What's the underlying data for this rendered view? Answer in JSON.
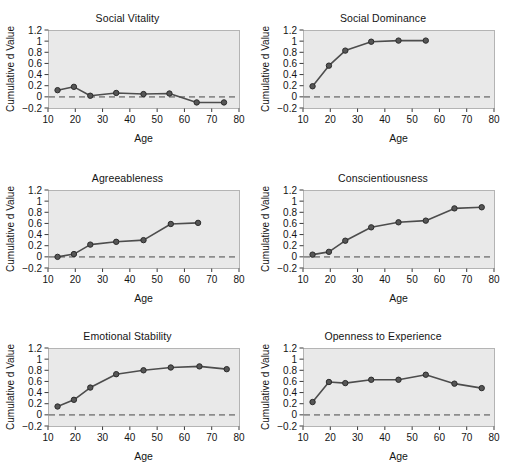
{
  "figure": {
    "axis_labels": {
      "x": "Age",
      "y": "Cumulative d Value"
    },
    "colors": {
      "plot_background": "#e9e9e9",
      "plot_border": "#b4b4b4",
      "line": "#4d4d4d",
      "marker_fill": "#565656",
      "marker_stroke": "#2b2b2b",
      "zero_line": "#8c8c8c",
      "text": "#141414",
      "page_background": "#ffffff"
    },
    "x_ticks": [
      "10",
      "20",
      "30",
      "40",
      "50",
      "60",
      "70",
      "80"
    ],
    "y_ticks": [
      "1.2",
      "1",
      "0.8",
      "0.6",
      "0.4",
      "0.2",
      "0",
      "−0.2"
    ]
  },
  "chart_data": [
    {
      "type": "line",
      "title": "Social Vitality",
      "xlabel": "Age",
      "ylabel": "Cumulative d Value",
      "xlim": [
        10,
        80
      ],
      "ylim": [
        -0.2,
        1.2
      ],
      "xticks": [
        10,
        20,
        30,
        40,
        50,
        60,
        70,
        80
      ],
      "yticks": [
        -0.2,
        0,
        0.2,
        0.4,
        0.6,
        0.8,
        1,
        1.2
      ],
      "grid": false,
      "legend": "none",
      "reference_line": {
        "y": 0,
        "style": "dashed"
      },
      "x": [
        13.5,
        19.5,
        25.5,
        35,
        45,
        54.5,
        64.5,
        74.5
      ],
      "values": [
        0.12,
        0.18,
        0.02,
        0.07,
        0.05,
        0.06,
        -0.1,
        -0.1
      ]
    },
    {
      "type": "line",
      "title": "Social Dominance",
      "xlabel": "Age",
      "ylabel": "Cumulative d Value",
      "xlim": [
        10,
        80
      ],
      "ylim": [
        -0.2,
        1.2
      ],
      "xticks": [
        10,
        20,
        30,
        40,
        50,
        60,
        70,
        80
      ],
      "yticks": [
        -0.2,
        0,
        0.2,
        0.4,
        0.6,
        0.8,
        1,
        1.2
      ],
      "grid": false,
      "legend": "none",
      "reference_line": {
        "y": 0,
        "style": "dashed"
      },
      "x": [
        13.5,
        19.5,
        25.5,
        35,
        45,
        55
      ],
      "values": [
        0.19,
        0.56,
        0.83,
        0.99,
        1.01,
        1.01
      ]
    },
    {
      "type": "line",
      "title": "Agreeableness",
      "xlabel": "Age",
      "ylabel": "Cumulative d Value",
      "xlim": [
        10,
        80
      ],
      "ylim": [
        -0.2,
        1.2
      ],
      "xticks": [
        10,
        20,
        30,
        40,
        50,
        60,
        70,
        80
      ],
      "yticks": [
        -0.2,
        0,
        0.2,
        0.4,
        0.6,
        0.8,
        1,
        1.2
      ],
      "grid": false,
      "legend": "none",
      "reference_line": {
        "y": 0,
        "style": "dashed"
      },
      "x": [
        13.5,
        19.5,
        25.5,
        35,
        45,
        55,
        65
      ],
      "values": [
        0.0,
        0.05,
        0.22,
        0.27,
        0.3,
        0.59,
        0.61
      ]
    },
    {
      "type": "line",
      "title": "Conscientiousness",
      "xlabel": "Age",
      "ylabel": "Cumulative d Value",
      "xlim": [
        10,
        80
      ],
      "ylim": [
        -0.2,
        1.2
      ],
      "xticks": [
        10,
        20,
        30,
        40,
        50,
        60,
        70,
        80
      ],
      "yticks": [
        -0.2,
        0,
        0.2,
        0.4,
        0.6,
        0.8,
        1,
        1.2
      ],
      "grid": false,
      "legend": "none",
      "reference_line": {
        "y": 0,
        "style": "dashed"
      },
      "x": [
        13.5,
        19.5,
        25.5,
        35,
        45,
        55,
        65.5,
        75.5
      ],
      "values": [
        0.04,
        0.09,
        0.29,
        0.53,
        0.62,
        0.65,
        0.87,
        0.89
      ]
    },
    {
      "type": "line",
      "title": "Emotional Stability",
      "xlabel": "Age",
      "ylabel": "Cumulative d Value",
      "xlim": [
        10,
        80
      ],
      "ylim": [
        -0.2,
        1.2
      ],
      "xticks": [
        10,
        20,
        30,
        40,
        50,
        60,
        70,
        80
      ],
      "yticks": [
        -0.2,
        0,
        0.2,
        0.4,
        0.6,
        0.8,
        1,
        1.2
      ],
      "grid": false,
      "legend": "none",
      "reference_line": {
        "y": 0,
        "style": "dashed"
      },
      "x": [
        13.5,
        19.5,
        25.5,
        35,
        45,
        55,
        65.5,
        75.5
      ],
      "values": [
        0.15,
        0.27,
        0.49,
        0.73,
        0.8,
        0.85,
        0.87,
        0.82
      ]
    },
    {
      "type": "line",
      "title": "Openness to Experience",
      "xlabel": "Age",
      "ylabel": "Cumulative d Value",
      "xlim": [
        10,
        80
      ],
      "ylim": [
        -0.2,
        1.2
      ],
      "xticks": [
        10,
        20,
        30,
        40,
        50,
        60,
        70,
        80
      ],
      "yticks": [
        -0.2,
        0,
        0.2,
        0.4,
        0.6,
        0.8,
        1,
        1.2
      ],
      "grid": false,
      "legend": "none",
      "reference_line": {
        "y": 0,
        "style": "dashed"
      },
      "x": [
        13.5,
        19.5,
        25.5,
        35,
        45,
        55,
        65.5,
        75.5
      ],
      "values": [
        0.23,
        0.59,
        0.57,
        0.63,
        0.63,
        0.72,
        0.56,
        0.48
      ]
    }
  ]
}
